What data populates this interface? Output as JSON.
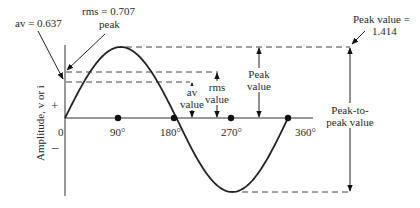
{
  "diagram": {
    "y_axis_label": "Amplitude, v or i",
    "positive_sign": "+",
    "negative_sign": "–",
    "origin_label": "0",
    "x_ticks": [
      "90°",
      "180°",
      "270°",
      "360°"
    ],
    "annotations": {
      "av_ratio": "av = 0.637",
      "rms_ratio_line1": "rms = 0.707",
      "rms_ratio_line2": "peak",
      "peak_ratio_line1": "Peak value =",
      "peak_ratio_line2": "1.414",
      "av_value_line1": "av",
      "av_value_line2": "value",
      "rms_value_line1": "rms",
      "rms_value_line2": "value",
      "peak_value_line1": "Peak",
      "peak_value_line2": "value",
      "p2p_line1": "Peak-to-",
      "p2p_line2": "peak value"
    },
    "ratios": {
      "av": 0.637,
      "rms": 0.707,
      "peak_to_rms": 1.414
    }
  }
}
